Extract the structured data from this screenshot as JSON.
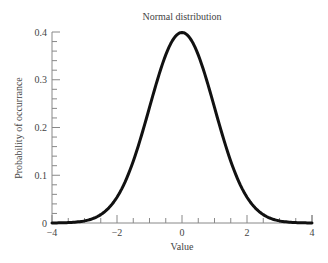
{
  "chart_data": {
    "type": "line",
    "title": "Normal distribution",
    "xlabel": "Value",
    "ylabel": "Probability of occurrance",
    "xlim": [
      -4,
      4
    ],
    "ylim": [
      0,
      0.4
    ],
    "x_ticks": [
      -4,
      -2,
      0,
      2,
      4
    ],
    "x_tick_labels": [
      "−4",
      "−2",
      "0",
      "2",
      "4"
    ],
    "y_ticks": [
      0,
      0.1,
      0.2,
      0.3,
      0.4
    ],
    "y_tick_labels": [
      "0",
      "0.1",
      "0.2",
      "0.3",
      "0.4"
    ],
    "x_minor_step": 0.5,
    "y_minor_step": 0.02,
    "grid": false,
    "legend": null,
    "series": [
      {
        "name": "Standard normal PDF (mean 0, sd 1)",
        "color": "#111111",
        "x": [
          -4,
          -3.5,
          -3,
          -2.5,
          -2,
          -1.5,
          -1,
          -0.5,
          0,
          0.5,
          1,
          1.5,
          2,
          2.5,
          3,
          3.5,
          4
        ],
        "y": [
          0.0001,
          0.0009,
          0.0044,
          0.0175,
          0.054,
          0.1295,
          0.242,
          0.3521,
          0.3989,
          0.3521,
          0.242,
          0.1295,
          0.054,
          0.0175,
          0.0044,
          0.0009,
          0.0001
        ]
      }
    ]
  },
  "colors": {
    "curve": "#111111",
    "axis": "#888888",
    "text": "#444444"
  }
}
